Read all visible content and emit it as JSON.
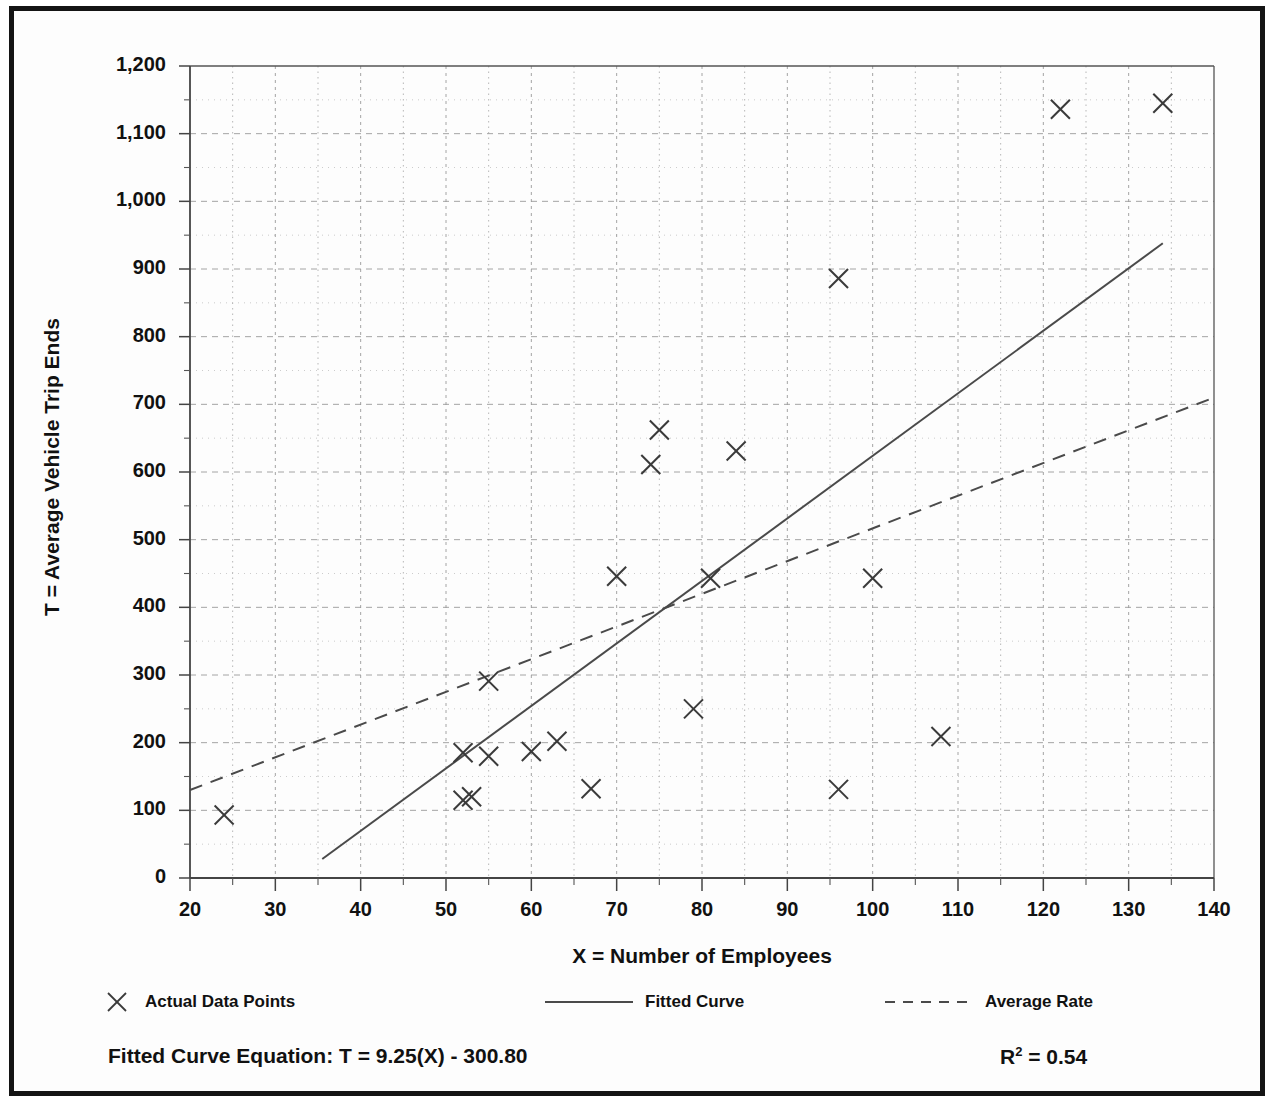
{
  "figure": {
    "y_axis_title": "T = Average Vehicle Trip Ends",
    "x_axis_title": "X = Number of Employees",
    "equation_label": "Fitted Curve Equation:  T = 9.25(X) - 300.80",
    "r2_label": "R2 = 0.54",
    "r2_prefix": "R",
    "r2_exponent": "2",
    "r2_suffix": " = 0.54"
  },
  "legend": {
    "position": "below-axis",
    "items": [
      {
        "label": "Actual Data Points",
        "marker": "x-marker-icon",
        "style": "marker"
      },
      {
        "label": "Fitted Curve",
        "marker": "solid-line-icon",
        "style": "solid"
      },
      {
        "label": "Average Rate",
        "marker": "dashed-line-icon",
        "style": "dashed"
      }
    ]
  },
  "chart_data": {
    "type": "scatter",
    "title": "",
    "xlabel": "X = Number of Employees",
    "ylabel": "T = Average Vehicle Trip Ends",
    "xlim": [
      20,
      140
    ],
    "ylim": [
      0,
      1200
    ],
    "grid": true,
    "x_ticks": [
      20,
      30,
      40,
      50,
      60,
      70,
      80,
      90,
      100,
      110,
      120,
      130,
      140
    ],
    "x_tick_labels": [
      "20",
      "30",
      "40",
      "50",
      "60",
      "70",
      "80",
      "90",
      "100",
      "110",
      "120",
      "130",
      "140"
    ],
    "x_minor_step": 5,
    "y_ticks": [
      0,
      100,
      200,
      300,
      400,
      500,
      600,
      700,
      800,
      900,
      1000,
      1100,
      1200
    ],
    "y_tick_labels": [
      "0",
      "100",
      "200",
      "300",
      "400",
      "500",
      "600",
      "700",
      "800",
      "900",
      "1,000",
      "1,100",
      "1,200"
    ],
    "y_minor_step": 50,
    "series": [
      {
        "name": "Actual Data Points",
        "type": "scatter",
        "marker": "x",
        "points": [
          [
            24,
            93
          ],
          [
            52,
            185
          ],
          [
            52,
            115
          ],
          [
            53,
            120
          ],
          [
            55,
            180
          ],
          [
            55,
            291
          ],
          [
            60,
            187
          ],
          [
            63,
            202
          ],
          [
            67,
            132
          ],
          [
            70,
            446
          ],
          [
            74,
            611
          ],
          [
            75,
            662
          ],
          [
            79,
            250
          ],
          [
            81,
            443
          ],
          [
            84,
            631
          ],
          [
            96,
            886
          ],
          [
            96,
            131
          ],
          [
            100,
            443
          ],
          [
            108,
            209
          ],
          [
            122,
            1136
          ],
          [
            134,
            1145
          ]
        ]
      },
      {
        "name": "Fitted Curve",
        "type": "line",
        "style": "solid",
        "equation": "T = 9.25(X) - 300.80",
        "slope": 9.25,
        "intercept": -300.8,
        "r_squared": 0.54,
        "endpoints": [
          [
            35.5,
            28
          ],
          [
            134,
            938
          ]
        ]
      },
      {
        "name": "Average Rate",
        "type": "line",
        "style": "dashed",
        "endpoints": [
          [
            20,
            130
          ],
          [
            140,
            710
          ]
        ]
      }
    ]
  },
  "colors": {
    "frame": "#141414",
    "axis": "#555555",
    "grid": "#9a9a9a",
    "marker": "#3a3a3a",
    "line": "#4a4a4a",
    "text": "#111111",
    "background": "#fdfdfd"
  }
}
